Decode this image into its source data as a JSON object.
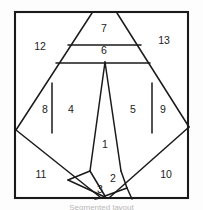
{
  "figure": {
    "background_color": "#ffffff",
    "line_color": "#1a1a1a",
    "label_color": "#222222",
    "caption": "Segmented layout",
    "frame": {
      "x": 14,
      "y": 11,
      "width": 175,
      "height": 188
    }
  },
  "regions": [
    {
      "id": "region-1",
      "label": "1",
      "label_x": 105,
      "label_y": 145,
      "points": "105,62 121,171 105,196 90,171"
    },
    {
      "id": "region-2",
      "label": "2",
      "label_x": 113,
      "label_y": 179,
      "points": "121,171 127,188 105,196"
    },
    {
      "id": "region-3",
      "label": "3",
      "label_x": 100,
      "label_y": 190,
      "points": "90,171 105,196 127,188 112,197 88,197"
    },
    {
      "id": "region-4",
      "label": "4",
      "label_x": 71,
      "label_y": 110,
      "points": "67,63 105,62 90,171 52,131"
    },
    {
      "id": "region-5",
      "label": "5",
      "label_x": 133,
      "label_y": 110,
      "points": "105,62 141,63 152,131 121,171"
    },
    {
      "id": "region-6",
      "label": "6",
      "label_x": 104,
      "label_y": 51,
      "points": "75,45 133,45 141,63 67,63"
    },
    {
      "id": "region-7",
      "label": "7",
      "label_x": 104,
      "label_y": 29,
      "points": "92,13 117,13 133,45 75,45"
    },
    {
      "id": "region-8",
      "label": "8",
      "label_x": 45,
      "label_y": 110,
      "points": "52,86 52,131 31,110"
    },
    {
      "id": "region-9",
      "label": "9",
      "label_x": 163,
      "label_y": 110,
      "points": "152,86 173,110 152,131"
    },
    {
      "id": "region-10",
      "label": "10",
      "label_x": 166,
      "label_y": 175,
      "points": "173,110 189,127 189,197 127,197"
    },
    {
      "id": "region-11",
      "label": "11",
      "label_x": 41,
      "label_y": 175,
      "points": "31,110 14,127 14,197 88,197"
    },
    {
      "id": "region-12",
      "label": "12",
      "label_x": 40,
      "label_y": 47,
      "points": "14,11 92,13 31,110 14,127"
    },
    {
      "id": "region-13",
      "label": "13",
      "label_x": 164,
      "label_y": 41,
      "points": "117,13 189,11 189,127 173,110"
    }
  ],
  "edges": [
    {
      "id": "edge-left-diagonal-upper",
      "d": "M 92,13 L 16,130"
    },
    {
      "id": "edge-right-diagonal-upper",
      "d": "M 117,13 L 189,127"
    },
    {
      "id": "edge-left-diagonal-lower",
      "d": "M 16,130 L 100,197"
    },
    {
      "id": "edge-right-diagonal-lower",
      "d": "M 189,127 L 110,197"
    },
    {
      "id": "edge-band-7-6",
      "d": "M 68,45 L 141,45"
    },
    {
      "id": "edge-band-6-base",
      "d": "M 56,63 L 150,63"
    },
    {
      "id": "edge-sliver-8",
      "d": "M 52,83 L 52,133"
    },
    {
      "id": "edge-sliver-9",
      "d": "M 152,83 L 152,133"
    },
    {
      "id": "edge-cone-left",
      "d": "M 105,62 L 90,171"
    },
    {
      "id": "edge-cone-right",
      "d": "M 105,62 L 121,171"
    },
    {
      "id": "edge-base-left",
      "d": "M 90,171 L 68,180"
    },
    {
      "id": "edge-base-right",
      "d": "M 121,171 L 127,188"
    },
    {
      "id": "edge-notch-left",
      "d": "M 68,180 L 105,197"
    },
    {
      "id": "edge-notch-right",
      "d": "M 105,196 L 127,188"
    },
    {
      "id": "edge-notch-cross",
      "d": "M 90,171 L 105,196"
    },
    {
      "id": "edge-bottom-tail-left",
      "d": "M 105,197 L 95,199"
    },
    {
      "id": "edge-bottom-tail-right",
      "d": "M 127,188 L 132,199"
    }
  ]
}
